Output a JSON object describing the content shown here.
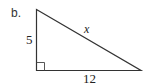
{
  "figure": {
    "part_label": "b.",
    "shape": "right-triangle",
    "sides": {
      "vertical_leg": "5",
      "horizontal_leg": "12",
      "hypotenuse": "x"
    },
    "right_angle_marker": true,
    "stroke_color": "#333333"
  }
}
